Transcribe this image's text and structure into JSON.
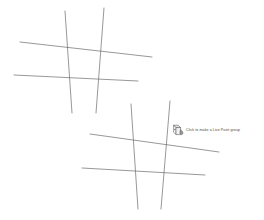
{
  "app": {
    "canvas_background": "#ffffff",
    "stroke_color": "#6b6b6b",
    "stroke_width": 0.7
  },
  "tooltip": {
    "icon": "live-paint-bucket-cursor-icon",
    "text": "Click to make a Live Paint group",
    "text_color": "#4a4a4a",
    "x": 173,
    "y": 124
  },
  "artwork": {
    "groups": [
      {
        "name": "upper-left-line-group",
        "strokes": [
          {
            "name": "stroke-horizontal-upper",
            "x1": 20,
            "y1": 42,
            "x2": 152,
            "y2": 57
          },
          {
            "name": "stroke-horizontal-lower",
            "x1": 14,
            "y1": 75,
            "x2": 138,
            "y2": 81
          },
          {
            "name": "stroke-vertical-left",
            "x1": 65,
            "y1": 11,
            "x2": 72,
            "y2": 113
          },
          {
            "name": "stroke-vertical-right",
            "x1": 104,
            "y1": 8,
            "x2": 96,
            "y2": 113
          }
        ]
      },
      {
        "name": "lower-right-line-group",
        "strokes": [
          {
            "name": "stroke-horizontal-upper",
            "x1": 90,
            "y1": 134,
            "x2": 219,
            "y2": 152
          },
          {
            "name": "stroke-horizontal-lower",
            "x1": 82,
            "y1": 168,
            "x2": 205,
            "y2": 175
          },
          {
            "name": "stroke-vertical-left",
            "x1": 131,
            "y1": 104,
            "x2": 138,
            "y2": 209
          },
          {
            "name": "stroke-vertical-right",
            "x1": 170,
            "y1": 101,
            "x2": 161,
            "y2": 209
          }
        ]
      }
    ]
  }
}
